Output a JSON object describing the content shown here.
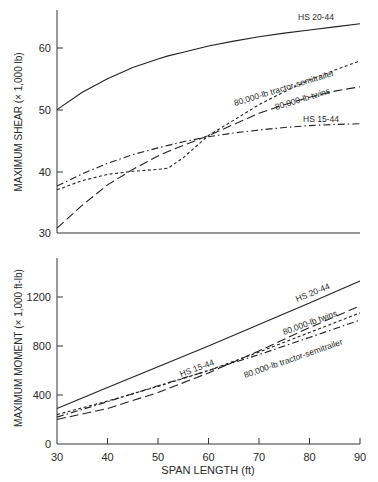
{
  "figure": {
    "xlabel": "SPAN LENGTH (ft)",
    "x_ticks": [
      30,
      40,
      50,
      60,
      70,
      80,
      90
    ]
  },
  "chart_data": [
    {
      "type": "line",
      "title": "",
      "xlabel": "SPAN LENGTH (ft)",
      "ylabel": "MAXIMUM SHEAR (× 1,000 lb)",
      "xlim": [
        30,
        90
      ],
      "ylim": [
        30,
        66
      ],
      "y_ticks": [
        30,
        40,
        50,
        60
      ],
      "grid": false,
      "legend": "inline labels",
      "x": [
        30,
        35,
        40,
        45,
        50,
        52,
        55,
        60,
        65,
        70,
        75,
        80,
        85,
        90
      ],
      "series": [
        {
          "name": "HS 20-44",
          "style": "solid",
          "values": [
            50.0,
            52.8,
            55.0,
            56.8,
            58.2,
            58.7,
            59.3,
            60.3,
            61.1,
            61.8,
            62.4,
            62.9,
            63.4,
            63.9
          ]
        },
        {
          "name": "80,000-lb tractor-semitrailer",
          "style": "short-dash",
          "values": [
            37.0,
            38.5,
            39.5,
            40.0,
            40.3,
            40.5,
            42.2,
            45.8,
            48.3,
            50.8,
            52.9,
            54.8,
            56.4,
            57.9
          ]
        },
        {
          "name": "80,000-lb twins",
          "style": "long-dash",
          "values": [
            30.8,
            34.5,
            37.8,
            40.3,
            42.5,
            43.2,
            44.2,
            45.8,
            47.6,
            49.4,
            50.8,
            52.0,
            53.0,
            53.7
          ]
        },
        {
          "name": "HS 15-44",
          "style": "dash-dot",
          "values": [
            37.6,
            39.6,
            41.3,
            42.7,
            43.8,
            44.2,
            44.8,
            45.6,
            46.2,
            46.7,
            47.1,
            47.4,
            47.6,
            47.7
          ]
        }
      ]
    },
    {
      "type": "line",
      "title": "",
      "xlabel": "SPAN LENGTH (ft)",
      "ylabel": "MAXIMUM MOMENT (× 1,000 ft-lb)",
      "xlim": [
        30,
        90
      ],
      "ylim": [
        0,
        1520
      ],
      "y_ticks": [
        0,
        400,
        800,
        1200
      ],
      "grid": false,
      "legend": "inline labels",
      "x": [
        30,
        40,
        50,
        60,
        70,
        80,
        90
      ],
      "series": [
        {
          "name": "HS 20-44",
          "style": "solid",
          "values": [
            290,
            460,
            630,
            800,
            975,
            1150,
            1330
          ]
        },
        {
          "name": "80,000-lb twins",
          "style": "long-dash",
          "values": [
            200,
            290,
            420,
            580,
            760,
            950,
            1127
          ]
        },
        {
          "name": "80,000-lb tractor-semitrailer",
          "style": "short-dash",
          "values": [
            240,
            350,
            470,
            600,
            750,
            910,
            1070
          ]
        },
        {
          "name": "HS 15-44",
          "style": "dash-dot",
          "values": [
            220,
            345,
            475,
            600,
            730,
            870,
            1012
          ]
        }
      ]
    }
  ],
  "labels": {
    "top": {
      "hs2044": "HS 20-44",
      "tractor": "80,000-lb tractor-semitrailer",
      "twins": "80,000-lb twins",
      "hs1544": "HS 15-44",
      "ylabel": "MAXIMUM SHEAR (× 1,000 lb)",
      "yt60": "60",
      "yt50": "50",
      "yt40": "40",
      "yt30": "30"
    },
    "bottom": {
      "hs2044": "HS 20-44",
      "twins": "80,000-lb twins",
      "hs1544": "HS 15-44",
      "tractor": "80,000-lb tractor-semitrailer",
      "ylabel": "MAXIMUM MOMENT (× 1,000 ft-lb)",
      "yt1200": "1200",
      "yt800": "800",
      "yt400": "400",
      "yt0": "0"
    },
    "xt30": "30",
    "xt40": "40",
    "xt50": "50",
    "xt60": "60",
    "xt70": "70",
    "xt80": "80",
    "xt90": "90"
  }
}
